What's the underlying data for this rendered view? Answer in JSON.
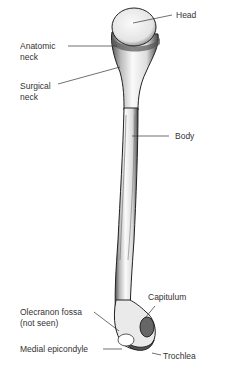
{
  "diagram": {
    "labels": {
      "head": "Head",
      "anatomic_neck_1": "Anatomic",
      "anatomic_neck_2": "neck",
      "surgical_neck_1": "Surgical",
      "surgical_neck_2": "neck",
      "body": "Body",
      "capitulum": "Capitulum",
      "olecranon_1": "Olecranon fossa",
      "olecranon_2": "(not seen)",
      "medial_epicondyle": "Medial epicondyle",
      "trochlea": "Trochlea"
    }
  }
}
